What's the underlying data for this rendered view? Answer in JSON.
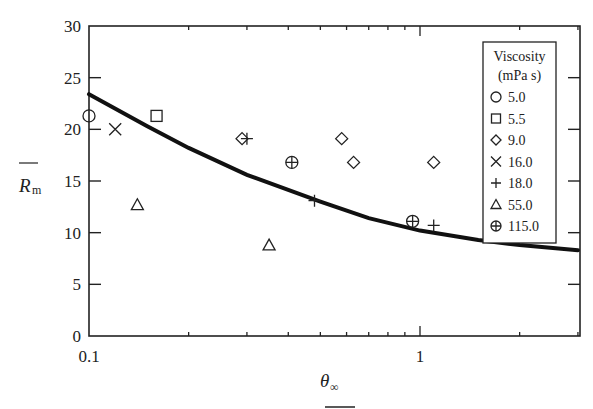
{
  "chart_data": {
    "type": "scatter",
    "title": "",
    "xlabel": "θ∞",
    "ylabel": "R̄m",
    "xscale": "log",
    "xlim": [
      0.1,
      3.0
    ],
    "ylim": [
      0,
      30
    ],
    "x_ticks": [
      {
        "value": 0.1,
        "label": "0.1"
      },
      {
        "value": 1,
        "label": "1"
      }
    ],
    "y_ticks": [
      {
        "value": 0,
        "label": "0"
      },
      {
        "value": 5,
        "label": "5"
      },
      {
        "value": 10,
        "label": "10"
      },
      {
        "value": 15,
        "label": "15"
      },
      {
        "value": 20,
        "label": "20"
      },
      {
        "value": 25,
        "label": "25"
      },
      {
        "value": 30,
        "label": "30"
      }
    ],
    "grid": false,
    "legend": {
      "position": "upper right (inside)",
      "title_line1": "Viscosity",
      "title_line2": "(mPa s)"
    },
    "series": [
      {
        "name": "5.0",
        "marker": "circle",
        "points": [
          [
            0.1,
            21.3
          ]
        ]
      },
      {
        "name": "5.5",
        "marker": "square",
        "points": [
          [
            0.16,
            21.3
          ]
        ]
      },
      {
        "name": "9.0",
        "marker": "diamond",
        "points": [
          [
            0.29,
            19.1
          ],
          [
            0.58,
            19.1
          ],
          [
            0.63,
            16.8
          ],
          [
            1.1,
            16.8
          ]
        ]
      },
      {
        "name": "16.0",
        "marker": "x",
        "points": [
          [
            0.12,
            20.0
          ]
        ]
      },
      {
        "name": "18.0",
        "marker": "plus",
        "points": [
          [
            0.3,
            19.1
          ],
          [
            0.48,
            13.1
          ],
          [
            1.1,
            10.7
          ]
        ]
      },
      {
        "name": "55.0",
        "marker": "triangle",
        "points": [
          [
            0.14,
            12.7
          ],
          [
            0.35,
            8.8
          ]
        ]
      },
      {
        "name": "115.0",
        "marker": "circle-plus",
        "points": [
          [
            0.41,
            16.8
          ],
          [
            0.95,
            11.1
          ]
        ]
      }
    ],
    "curve": {
      "name": "model fit",
      "style": "thick solid black line",
      "points": [
        [
          0.1,
          23.4
        ],
        [
          0.15,
          20.3
        ],
        [
          0.2,
          18.2
        ],
        [
          0.3,
          15.6
        ],
        [
          0.5,
          13.0
        ],
        [
          0.7,
          11.4
        ],
        [
          1.0,
          10.2
        ],
        [
          1.5,
          9.3
        ],
        [
          2.0,
          8.8
        ],
        [
          3.0,
          8.3
        ]
      ]
    }
  }
}
